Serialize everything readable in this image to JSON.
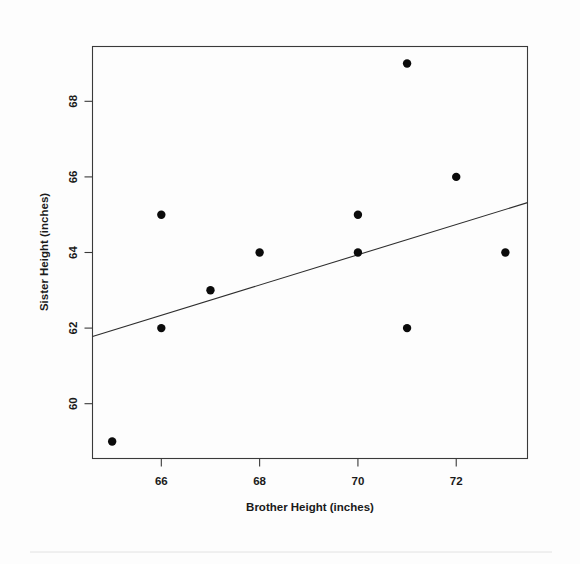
{
  "figure": {
    "name": "brother-sister-height-scatterplot",
    "background_color": "#fdfdfd",
    "point_color": "#0b0b0b",
    "line_color": "#2e2e2e",
    "frame_color": "#3a3a3a"
  },
  "chart_data": {
    "type": "scatter",
    "title": "",
    "xlabel": "Brother Height (inches)",
    "ylabel": "Sister Height (inches)",
    "xlim": [
      64.6,
      73.45
    ],
    "ylim": [
      58.55,
      69.45
    ],
    "xticks": [
      66,
      68,
      70,
      72
    ],
    "xtick_labels": [
      "66",
      "68",
      "70",
      "72"
    ],
    "yticks": [
      60,
      62,
      64,
      66,
      68
    ],
    "ytick_labels": [
      "60",
      "62",
      "64",
      "66",
      "68"
    ],
    "grid": false,
    "legend": null,
    "x": [
      65,
      66,
      66,
      67,
      68,
      70,
      70,
      71,
      71,
      72,
      73
    ],
    "y": [
      59,
      65,
      62,
      63,
      64,
      65,
      64,
      69,
      62,
      66,
      64
    ],
    "points": [
      {
        "x": 65,
        "y": 59
      },
      {
        "x": 66,
        "y": 65
      },
      {
        "x": 66,
        "y": 62
      },
      {
        "x": 67,
        "y": 63
      },
      {
        "x": 68,
        "y": 64
      },
      {
        "x": 70,
        "y": 65
      },
      {
        "x": 70,
        "y": 64
      },
      {
        "x": 71,
        "y": 69
      },
      {
        "x": 71,
        "y": 62
      },
      {
        "x": 72,
        "y": 66
      },
      {
        "x": 73,
        "y": 64
      }
    ],
    "point_radius": 4.2,
    "series": [
      {
        "name": "sibling-heights",
        "marker": "filled-circle",
        "values": [
          59,
          65,
          62,
          63,
          64,
          65,
          64,
          69,
          62,
          66,
          64
        ]
      }
    ],
    "trendline": {
      "type": "linear-regression",
      "x_start": 64.6,
      "y_start": 61.78,
      "x_end": 73.45,
      "y_end": 65.32,
      "style": "solid"
    }
  }
}
